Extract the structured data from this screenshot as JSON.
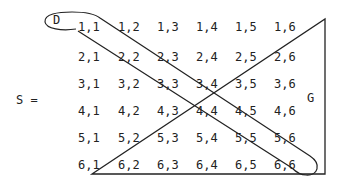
{
  "set_label": "S =",
  "region_labels": {
    "D": "D",
    "G": "G"
  },
  "grid": {
    "rows": [
      [
        "1,1",
        "1,2",
        "1,3",
        "1,4",
        "1,5",
        "1,6"
      ],
      [
        "2,1",
        "2,2",
        "2,3",
        "2,4",
        "2,5",
        "2,6"
      ],
      [
        "3,1",
        "3,2",
        "3,3",
        "3,4",
        "3,5",
        "3,6"
      ],
      [
        "4,1",
        "4,2",
        "4,3",
        "4,4",
        "4,5",
        "4,6"
      ],
      [
        "5,1",
        "5,2",
        "5,3",
        "5,4",
        "5,5",
        "5,6"
      ],
      [
        "6,1",
        "6,2",
        "6,3",
        "6,4",
        "6,5",
        "6,6"
      ]
    ]
  },
  "colors": {
    "ink": "#222222",
    "background": "#ffffff"
  }
}
